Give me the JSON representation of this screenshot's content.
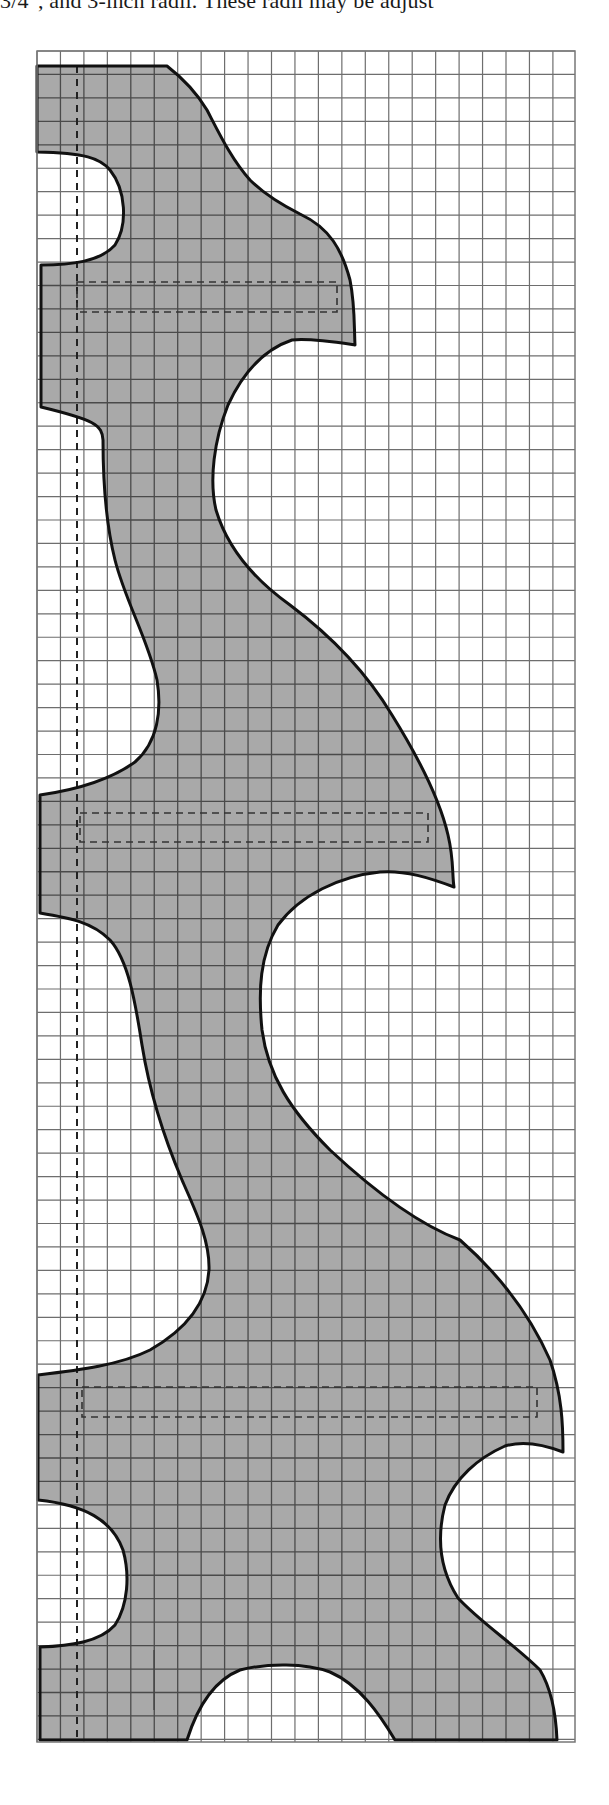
{
  "caption": {
    "text": "3/4\", and 3-inch radii. These radii may be adjust"
  },
  "diagram": {
    "type": "pattern-template-on-grid",
    "grid": {
      "left": 37,
      "top": 51,
      "right": 575,
      "bottom": 1742,
      "cell": 23.45,
      "line_color": "#6e6e6e",
      "line_width": 1.2
    },
    "shape": {
      "fill": "#a9a9a9",
      "stroke": "#111111",
      "stroke_width": 3,
      "path": "M 37 66 L 167 66 C 185 80 198 95 207 110 C 220 135 232 160 250 180 C 265 195 282 205 300 214 C 330 228 342 250 350 280 C 355 305 354 325 355 345 C 335 342 310 338 292 340 C 262 350 242 375 228 405 C 214 440 209 480 216 510 C 228 550 255 580 290 605 C 330 635 365 670 392 715 C 420 760 440 800 448 835 C 454 860 452 875 454 887 C 430 878 405 870 380 872 C 340 876 300 895 278 925 C 260 955 258 990 262 1030 C 268 1075 290 1110 330 1150 C 375 1192 420 1225 460 1240 C 500 1275 530 1315 550 1360 C 562 1395 563 1425 563 1452 C 545 1445 525 1440 505 1446 C 478 1458 455 1478 445 1505 C 436 1540 440 1570 458 1598 C 480 1622 515 1645 540 1670 C 552 1690 556 1715 557 1740 L 395 1740 C 380 1715 360 1685 330 1672 C 305 1663 268 1663 240 1670 C 215 1680 198 1705 187 1740 L 40 1740 L 40 1647 C 70 1646 100 1642 115 1625 C 128 1605 130 1575 123 1550 C 112 1520 85 1505 38 1500 L 38 1375 C 80 1370 120 1365 150 1350 C 185 1330 207 1305 209 1270 C 210 1240 195 1210 182 1180 C 165 1140 150 1095 142 1045 C 135 1000 128 960 110 940 C 92 922 70 918 40 913 L 40 795 C 75 790 110 780 135 762 C 158 742 162 710 157 680 C 148 640 125 600 115 560 C 105 520 103 470 103 440 C 102 425 95 420 41 407 L 41 265 C 70 265 100 262 115 245 C 128 225 126 190 110 170 C 100 158 85 153 37 152 Z"
    },
    "center_line": {
      "x": 77,
      "y1": 66,
      "y2": 1740,
      "dash": "7,6",
      "color": "#222222"
    },
    "slots": [
      {
        "name": "slot-1",
        "x": 77,
        "y": 282,
        "width": 260,
        "height": 30
      },
      {
        "name": "slot-2",
        "x": 80,
        "y": 813,
        "width": 348,
        "height": 29
      },
      {
        "name": "slot-3",
        "x": 82,
        "y": 1387,
        "width": 455,
        "height": 30
      }
    ],
    "slot_style": {
      "stroke": "#333333",
      "dash": "7,5",
      "stroke_width": 1.6
    },
    "stray_mark": {
      "x": 154,
      "y1": 1650,
      "y2": 1710
    }
  }
}
